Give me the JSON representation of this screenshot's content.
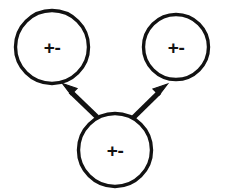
{
  "diagram": {
    "canvas": {
      "width": 227,
      "height": 189,
      "background": "#ffffff"
    },
    "stroke_color": "#121212",
    "nodes": [
      {
        "id": "node-top-left",
        "name": "circle-node-top-left",
        "label": "+-",
        "cx": 52,
        "cy": 47,
        "r": 36.5
      },
      {
        "id": "node-top-right",
        "name": "circle-node-top-right",
        "label": "+-",
        "cx": 176,
        "cy": 47,
        "r": 32.5
      },
      {
        "id": "node-bottom",
        "name": "circle-node-bottom",
        "label": "+-",
        "cx": 115,
        "cy": 150,
        "r": 36.5
      }
    ],
    "arrows": [
      {
        "id": "arrow-left",
        "name": "arrow-bottom-to-top-left",
        "from": "node-bottom",
        "to": "node-top-left",
        "direction": "up-left",
        "tail_x": 97,
        "tail_y": 117,
        "tip_x": 64,
        "tip_y": 85
      },
      {
        "id": "arrow-right",
        "name": "arrow-bottom-to-top-right",
        "from": "node-bottom",
        "to": "node-top-right",
        "direction": "up-right",
        "tail_x": 133,
        "tail_y": 118,
        "tip_x": 166,
        "tip_y": 85
      }
    ]
  }
}
